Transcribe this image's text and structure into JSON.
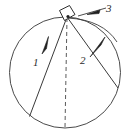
{
  "figure": {
    "background_color": "#ffffff",
    "stroke_color": "#3a3a3a",
    "label_color": "#2b2b2b",
    "width": 133,
    "height": 138
  },
  "circle": {
    "name": "vertical-circle",
    "center_x": 65,
    "center_y": 72.5,
    "radius": 55.5,
    "stroke": "#4a4a4a",
    "stroke_width": 1,
    "fill": "none"
  },
  "apex": {
    "name": "top-of-circle",
    "x": 67,
    "y": 17
  },
  "block": {
    "name": "block-at-apex",
    "description": "small tilted square block resting at top of circle",
    "corners": "59,10 70,5 75,15 64,21"
  },
  "dashed_diameter": {
    "name": "vertical-diameter",
    "x1": 67,
    "y1": 17,
    "x2": 65,
    "y2": 128,
    "dash": "4 3"
  },
  "chords": [
    {
      "id": "chord-1",
      "label": "1",
      "label_x": 33,
      "label_y": 57,
      "x1": 67,
      "y1": 17,
      "x2": 29,
      "y2": 117,
      "arrow_direction": "down-left",
      "arrow_x": 45,
      "arrow_y": 45
    },
    {
      "id": "chord-2",
      "label": "2",
      "label_x": 80,
      "label_y": 55,
      "x1": 67,
      "y1": 17,
      "x2": 118,
      "y2": 88,
      "arrow_direction": "up-right",
      "arrow_x": 98,
      "arrow_y": 48
    }
  ],
  "arc_path": {
    "id": "arc-3",
    "label": "3",
    "label_x": 106,
    "label_y": 3,
    "description": "thin arc from apex curving right to the circle rim",
    "arrow_direction": "left-toward-apex",
    "start_x": 67,
    "start_y": 17,
    "end_x": 116,
    "end_y": 40
  },
  "labels": {
    "one": "1",
    "two": "2",
    "three": "3"
  }
}
